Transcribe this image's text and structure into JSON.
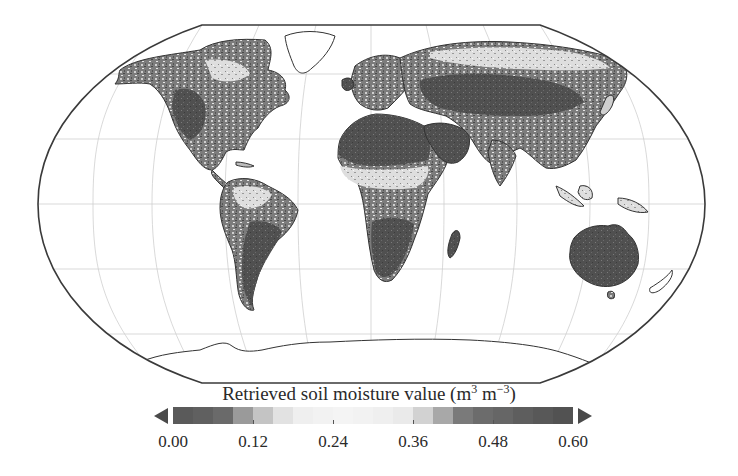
{
  "figure": {
    "projection": "Robinson",
    "colorbar": {
      "title": "Retrieved soil moisture value (m",
      "unit_exp1": "3",
      "unit_mid": " m",
      "unit_exp2": "−3",
      "unit_close": ")",
      "extend": "both",
      "ticks": [
        "0.00",
        "0.12",
        "0.24",
        "0.36",
        "0.48",
        "0.60"
      ],
      "segment_colors": [
        "#5a5a5a",
        "#606060",
        "#6a6a6a",
        "#9a9a9a",
        "#c4c4c4",
        "#e2e2e2",
        "#efefef",
        "#f2f2f2",
        "#f4f4f4",
        "#f2f2f2",
        "#efefef",
        "#eaeaea",
        "#d2d2d2",
        "#a8a8a8",
        "#7a7a7a",
        "#6c6c6c",
        "#666666",
        "#5e5e5e",
        "#585858",
        "#525252"
      ],
      "arrow_color": "#4a4a4a"
    },
    "colors": {
      "outline": "#3a3a3a",
      "graticule": "#c8c8c8",
      "dry": "#4e4e4e",
      "medium": "#7a7a7a",
      "wet": "#e4e4e4",
      "ice": "#ffffff"
    }
  },
  "chart_data": {
    "type": "heatmap",
    "title": "",
    "subtitle": "Global map of retrieved soil moisture (grayscale)",
    "colorbar_label": "Retrieved soil moisture value (m3 m-3)",
    "colorbar_range": [
      0.0,
      0.6
    ],
    "colorbar_ticks": [
      0.0,
      0.12,
      0.24,
      0.36,
      0.48,
      0.6
    ],
    "colorbar_extend": "both",
    "graticule": {
      "latitudes": [
        -60,
        -30,
        0,
        30,
        60
      ],
      "meridian_spacing_deg": 30
    },
    "regions": [
      {
        "name": "Sahara / Arabia",
        "appearance": "dark (low/high end of scale)"
      },
      {
        "name": "Sahel band",
        "appearance": "light (mid values)"
      },
      {
        "name": "Central Asia / Siberia",
        "appearance": "dark"
      },
      {
        "name": "Australia",
        "appearance": "dark"
      },
      {
        "name": "Southern Africa",
        "appearance": "dark"
      },
      {
        "name": "Amazon basin",
        "appearance": "light with dark patches"
      },
      {
        "name": "North America interior",
        "appearance": "mixed dark"
      },
      {
        "name": "Greenland / Antarctica",
        "appearance": "no data (white)"
      }
    ]
  }
}
